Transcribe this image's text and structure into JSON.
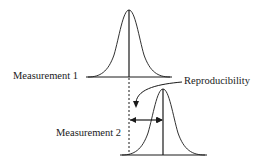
{
  "diagram": {
    "labels": {
      "measurement_1": "Measurement 1",
      "measurement_2": "Measurement 2",
      "reproducibility": "Reproducibility"
    },
    "colors": {
      "stroke": "#1a1a1a",
      "background": "#ffffff"
    },
    "elements": [
      {
        "id": "curve-1",
        "type": "gaussian-curve",
        "label_ref": "measurement_1",
        "peak": [
          129,
          10
        ],
        "baseline_y": 77,
        "x_range": [
          86,
          172
        ]
      },
      {
        "id": "mean-line-1",
        "type": "vertical-line",
        "x": 129
      },
      {
        "id": "curve-2",
        "type": "gaussian-curve",
        "label_ref": "measurement_2",
        "peak": [
          163,
          89
        ],
        "baseline_y": 155,
        "x_range": [
          120,
          207
        ]
      },
      {
        "id": "mean-line-2",
        "type": "vertical-line",
        "x": 163
      },
      {
        "id": "dashed-reference",
        "type": "dashed-line",
        "x": 129
      },
      {
        "id": "double-arrow",
        "type": "double-headed-arrow",
        "from_x": 129,
        "to_x": 163,
        "y": 120
      },
      {
        "id": "callout-arrow",
        "type": "curved-arrow",
        "label_ref": "reproducibility"
      }
    ]
  }
}
